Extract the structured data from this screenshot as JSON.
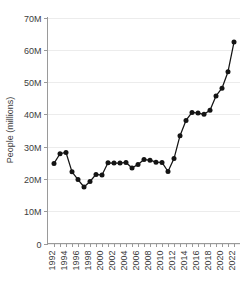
{
  "chart_data": {
    "type": "line",
    "title": "",
    "xlabel": "",
    "ylabel": "People (millions)",
    "ylim": [
      0,
      70000000
    ],
    "xlim": [
      1992,
      2022
    ],
    "grid": true,
    "legend": false,
    "y_ticks": [
      0,
      10000000,
      20000000,
      30000000,
      40000000,
      50000000,
      60000000,
      70000000
    ],
    "y_tick_labels": [
      "0",
      "10M",
      "20M",
      "30M",
      "40M",
      "50M",
      "60M",
      "70M"
    ],
    "x_ticks": [
      1992,
      1993,
      1994,
      1995,
      1996,
      1997,
      1998,
      1999,
      2000,
      2001,
      2002,
      2003,
      2004,
      2005,
      2006,
      2007,
      2008,
      2009,
      2010,
      2011,
      2012,
      2013,
      2014,
      2015,
      2016,
      2017,
      2018,
      2019,
      2020,
      2021,
      2022
    ],
    "x_tick_labels": [
      "1992",
      "",
      "1994",
      "",
      "1996",
      "",
      "1998",
      "",
      "2000",
      "",
      "2002",
      "",
      "2004",
      "",
      "2006",
      "",
      "2008",
      "",
      "2010",
      "",
      "2012",
      "",
      "2014",
      "",
      "2016",
      "",
      "2018",
      "",
      "2020",
      "",
      "2022"
    ],
    "x": [
      1992,
      1993,
      1994,
      1995,
      1996,
      1997,
      1998,
      1999,
      2000,
      2001,
      2002,
      2003,
      2004,
      2005,
      2006,
      2007,
      2008,
      2009,
      2010,
      2011,
      2012,
      2013,
      2014,
      2015,
      2016,
      2017,
      2018,
      2019,
      2020,
      2021,
      2022
    ],
    "values": [
      24.8,
      27.8,
      28.2,
      22.2,
      19.8,
      17.5,
      19.2,
      21.4,
      21.2,
      25.0,
      24.9,
      24.9,
      25.1,
      23.4,
      24.5,
      26.0,
      25.8,
      25.2,
      25.1,
      22.3,
      26.3,
      33.4,
      38.1,
      40.6,
      40.4,
      40.0,
      41.3,
      45.7,
      48.1,
      53.2,
      62.4
    ],
    "value_units": "millions",
    "series": [
      {
        "name": "People (millions)",
        "values": [
          24.8,
          27.8,
          28.2,
          22.2,
          19.8,
          17.5,
          19.2,
          21.4,
          21.2,
          25.0,
          24.9,
          24.9,
          25.1,
          23.4,
          24.5,
          26.0,
          25.8,
          25.2,
          25.1,
          22.3,
          26.3,
          33.4,
          38.1,
          40.6,
          40.4,
          40.0,
          41.3,
          45.7,
          48.1,
          53.2,
          62.4
        ],
        "color": "#141414",
        "marker": "circle"
      }
    ],
    "colors": {
      "line": "#141414",
      "marker": "#141414",
      "grid": "#ececec",
      "axis": "#9a9a9a",
      "text": "#3d3d3d",
      "background": "#ffffff"
    }
  }
}
